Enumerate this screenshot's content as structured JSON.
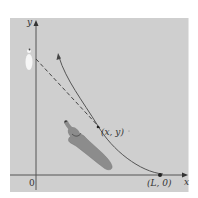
{
  "diagram": {
    "title": "",
    "colors": {
      "background": "#ffffff",
      "panel": "#cfcfcf",
      "axis": "#555555",
      "curve": "#555555",
      "dog": "#8a8a8a",
      "person": "#f4f4f4"
    },
    "axes": {
      "x_label": "x",
      "y_label": "y",
      "origin_label": "0"
    },
    "points": {
      "start_point_label": "(L, 0)",
      "current_point_label": "(x, y)"
    },
    "elements": {
      "curve": "pursuit-curve",
      "tangent": "dashed-tangent-line",
      "pursuer": "dog-figure",
      "target": "person-figure"
    }
  }
}
